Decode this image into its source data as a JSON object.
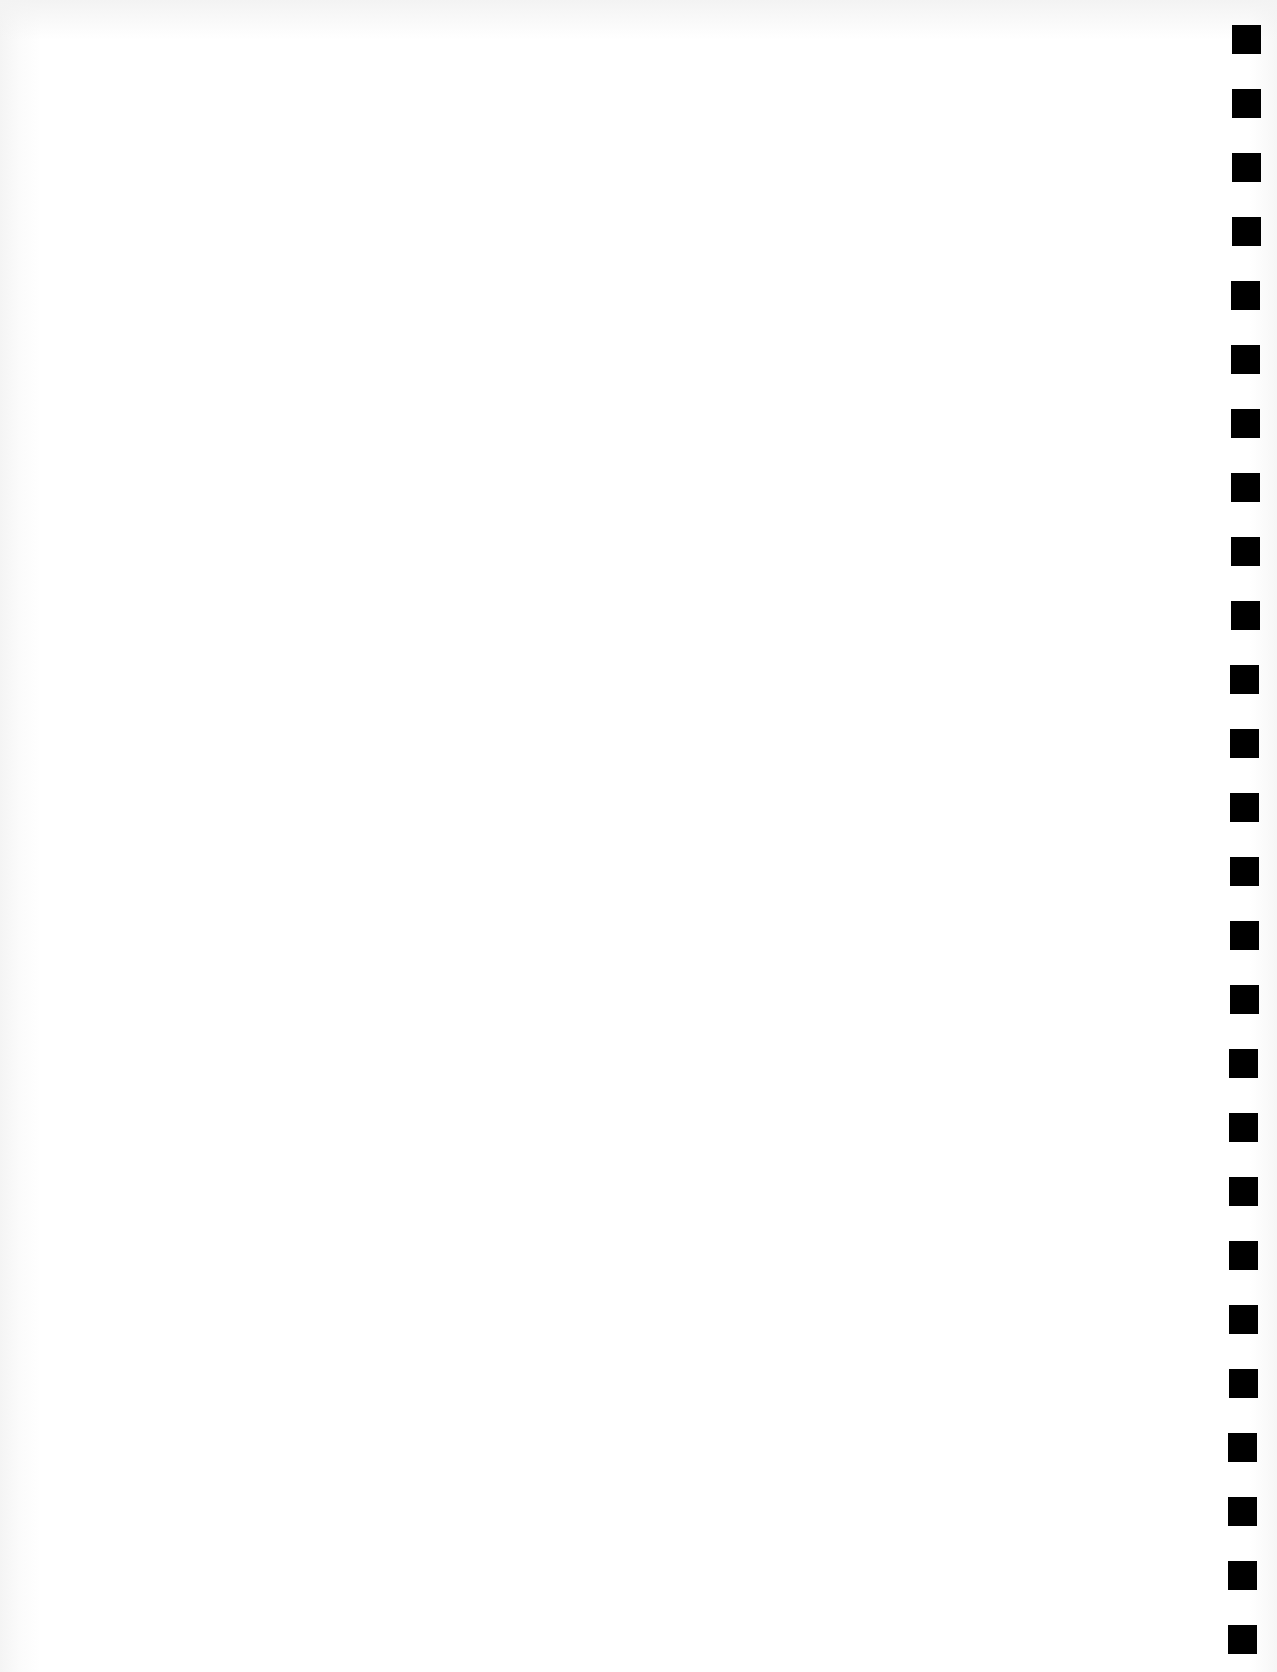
{
  "page": {
    "background_color": "#ffffff",
    "mark_color": "#000000"
  },
  "binding_marks": {
    "count": 26,
    "shape": "square",
    "size_px": 29,
    "first_top_px": 25,
    "spacing_px": 64,
    "left_px_top": 1232,
    "left_px_bottom": 1228
  }
}
